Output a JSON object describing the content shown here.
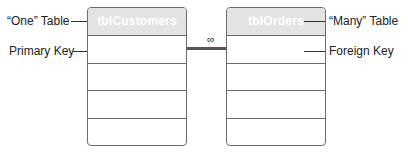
{
  "diagram": {
    "left_table": {
      "name": "tblCustomers",
      "rows": 4,
      "callouts": {
        "header": "“One” Table",
        "first_row": "Primary Key"
      }
    },
    "right_table": {
      "name": "tblOrders",
      "rows": 4,
      "callouts": {
        "header": "“Many” Table",
        "first_row": "Foreign Key"
      }
    },
    "relationship": {
      "type": "one-to-many",
      "many_symbol": "∞"
    },
    "colors": {
      "header_fill": "#e3e3e3",
      "header_text": "#ffffff",
      "border": "#6b6b6b",
      "line": "#555555"
    }
  }
}
